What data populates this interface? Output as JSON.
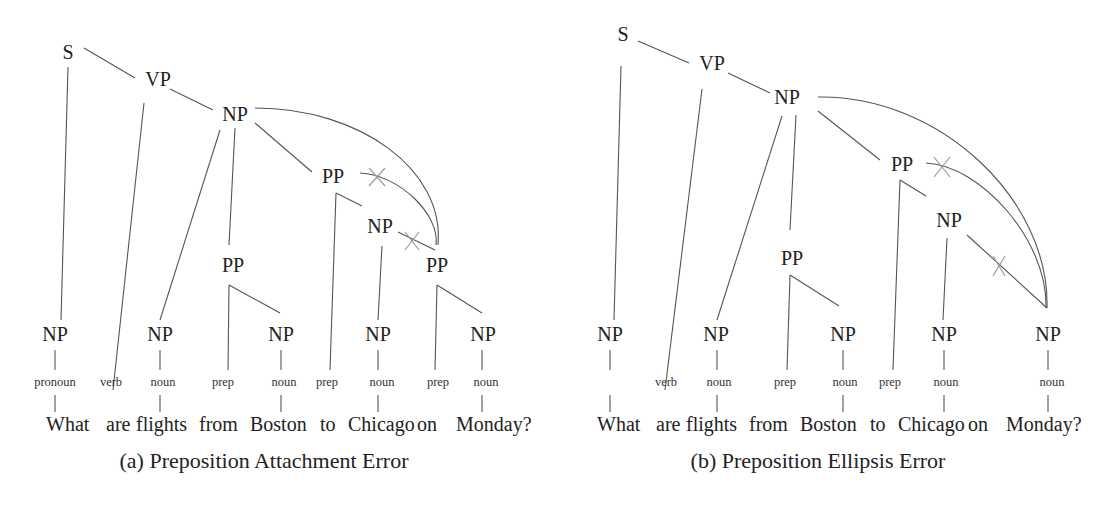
{
  "figure_a": {
    "caption": "(a) Preposition Attachment Error",
    "nodes": {
      "s": "S",
      "vp": "VP",
      "np_top": "NP",
      "pp_mid": "PP",
      "pp_right": "PP",
      "np_mid": "NP",
      "pp_low": "PP",
      "np_what": "NP",
      "np_flights": "NP",
      "np_boston": "NP",
      "np_chicago": "NP",
      "np_monday": "NP"
    },
    "pos": [
      "pronoun",
      "verb",
      "noun",
      "prep",
      "noun",
      "prep",
      "noun",
      "prep",
      "noun"
    ],
    "words": [
      "What",
      "are",
      "flights",
      "from",
      "Boston",
      "to",
      "Chicago",
      "on",
      "Monday?"
    ]
  },
  "figure_b": {
    "caption": "(b) Preposition Ellipsis Error",
    "nodes": {
      "s": "S",
      "vp": "VP",
      "np_top": "NP",
      "pp_right": "PP",
      "np_mid": "NP",
      "pp_low": "PP",
      "np_what": "NP",
      "np_flights": "NP",
      "np_boston": "NP",
      "np_chicago": "NP",
      "np_monday": "NP"
    },
    "pos": [
      "verb",
      "noun",
      "prep",
      "noun",
      "prep",
      "noun",
      "noun"
    ],
    "words": [
      "What",
      "are",
      "flights",
      "from",
      "Boston",
      "to",
      "Chicago",
      "on",
      "Monday?"
    ]
  },
  "colors": {
    "text": "#222222",
    "edge": "#555555",
    "cross": "#9a9a9a",
    "background": "#ffffff"
  }
}
